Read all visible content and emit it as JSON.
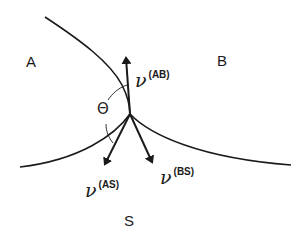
{
  "diagram": {
    "regions": {
      "A": "A",
      "B": "B",
      "S": "S"
    },
    "vectors": [
      {
        "id": "AB",
        "symbol": "ν",
        "superscript": "(AB)"
      },
      {
        "id": "AS",
        "symbol": "ν",
        "superscript": "(AS)"
      },
      {
        "id": "BS",
        "symbol": "ν",
        "superscript": "(BS)"
      }
    ],
    "angle_label": "Θ",
    "colors": {
      "stroke": "#1a1a1a",
      "background": "#ffffff"
    }
  }
}
